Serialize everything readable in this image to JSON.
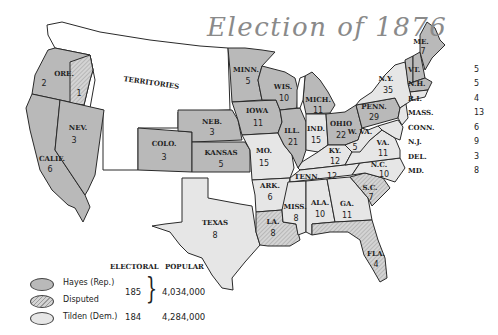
{
  "title": "Election of 1876",
  "colors": {
    "hayes_rep": "#b9b9b9",
    "tilden_dem": "#e6e6e6",
    "disputed": "hatched #c9c9c9",
    "territories": "#ffffff",
    "border": "#2a2a2a"
  },
  "map": {
    "territories_label": "TERRITORIES",
    "states": [
      {
        "name": "ORE.",
        "votes": "2",
        "party": "Hayes"
      },
      {
        "name": "",
        "votes": "1",
        "party": "Disputed",
        "note": "Oregon disputed elector"
      },
      {
        "name": "NEV.",
        "votes": "3",
        "party": "Hayes"
      },
      {
        "name": "CALIF.",
        "votes": "6",
        "party": "Hayes"
      },
      {
        "name": "COLO.",
        "votes": "3",
        "party": "Hayes"
      },
      {
        "name": "NEB.",
        "votes": "3",
        "party": "Hayes"
      },
      {
        "name": "KANSAS",
        "votes": "5",
        "party": "Hayes"
      },
      {
        "name": "TEXAS",
        "votes": "8",
        "party": "Tilden"
      },
      {
        "name": "MINN.",
        "votes": "5",
        "party": "Hayes"
      },
      {
        "name": "IOWA",
        "votes": "11",
        "party": "Hayes"
      },
      {
        "name": "MO.",
        "votes": "15",
        "party": "Tilden"
      },
      {
        "name": "ARK.",
        "votes": "6",
        "party": "Tilden"
      },
      {
        "name": "LA.",
        "votes": "8",
        "party": "Disputed"
      },
      {
        "name": "WIS.",
        "votes": "10",
        "party": "Hayes"
      },
      {
        "name": "ILL.",
        "votes": "21",
        "party": "Hayes"
      },
      {
        "name": "MICH.",
        "votes": "11",
        "party": "Hayes"
      },
      {
        "name": "IND.",
        "votes": "15",
        "party": "Tilden"
      },
      {
        "name": "OHIO",
        "votes": "22",
        "party": "Hayes"
      },
      {
        "name": "KY.",
        "votes": "12",
        "party": "Tilden"
      },
      {
        "name": "TENN.",
        "votes": "12",
        "party": "Tilden"
      },
      {
        "name": "MISS.",
        "votes": "8",
        "party": "Tilden"
      },
      {
        "name": "ALA.",
        "votes": "10",
        "party": "Tilden"
      },
      {
        "name": "GA.",
        "votes": "11",
        "party": "Tilden"
      },
      {
        "name": "FLA.",
        "votes": "4",
        "party": "Disputed"
      },
      {
        "name": "S.C.",
        "votes": "7",
        "party": "Disputed"
      },
      {
        "name": "N.C.",
        "votes": "10",
        "party": "Tilden"
      },
      {
        "name": "VA.",
        "votes": "11",
        "party": "Tilden"
      },
      {
        "name": "W. VA.",
        "votes": "5",
        "party": "Tilden"
      },
      {
        "name": "PENN.",
        "votes": "29",
        "party": "Hayes"
      },
      {
        "name": "N.Y.",
        "votes": "35",
        "party": "Tilden"
      },
      {
        "name": "ME.",
        "votes": "7",
        "party": "Hayes"
      }
    ]
  },
  "side_list": [
    {
      "name": "VT.",
      "votes": "5"
    },
    {
      "name": "N.H.",
      "votes": "5"
    },
    {
      "name": "R.I.",
      "votes": "4"
    },
    {
      "name": "MASS.",
      "votes": "13"
    },
    {
      "name": "CONN.",
      "votes": "6"
    },
    {
      "name": "N.J.",
      "votes": "9"
    },
    {
      "name": "DEL.",
      "votes": "3"
    },
    {
      "name": "MD.",
      "votes": "8"
    }
  ],
  "legend": {
    "col_electoral": "ELECTORAL",
    "col_popular": "POPULAR",
    "items": [
      {
        "label": "Hayes (Rep.)"
      },
      {
        "label": "Disputed"
      },
      {
        "label": "Tilden (Dem.)"
      }
    ],
    "hayes_disputed_electoral": "185",
    "hayes_popular": "4,034,000",
    "tilden_electoral": "184",
    "tilden_popular": "4,284,000"
  }
}
